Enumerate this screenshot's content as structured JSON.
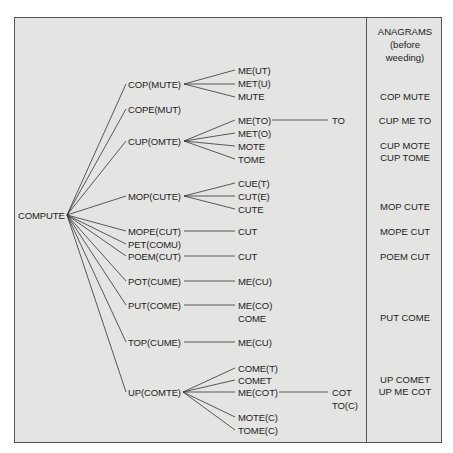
{
  "diagram": {
    "root": "COMPUTE",
    "level1": [
      {
        "label": "COP(MUTE)",
        "children": [
          "ME(UT)",
          "MET(U)",
          "MUTE"
        ]
      },
      {
        "label": "COPE(MUT)",
        "children": []
      },
      {
        "label": "CUP(OMTE)",
        "children": [
          "ME(TO)",
          "MET(O)",
          "MOTE",
          "TOME"
        ],
        "grandchildren": {
          "ME(TO)": [
            "TO"
          ]
        }
      },
      {
        "label": "MOP(CUTE)",
        "children": [
          "CUE(T)",
          "CUT(E)",
          "CUTE"
        ]
      },
      {
        "label": "MOPE(CUT)",
        "children": [
          "CUT"
        ]
      },
      {
        "label": "PET(COMU)",
        "children": []
      },
      {
        "label": "POEM(CUT)",
        "children": [
          "CUT"
        ]
      },
      {
        "label": "POT(CUME)",
        "children": [
          "ME(CU)"
        ]
      },
      {
        "label": "PUT(COME)",
        "children": [
          "ME(CO)",
          "COME"
        ]
      },
      {
        "label": "TOP(CUME)",
        "children": [
          "ME(CU)"
        ]
      },
      {
        "label": "UP(COMTE)",
        "children": [
          "COME(T)",
          "COMET",
          "ME(COT)",
          "MOTE(C)",
          "TOME(C)"
        ],
        "grandchildren": {
          "ME(COT)": [
            "COT",
            "TO(C)"
          ]
        }
      }
    ],
    "l1": {
      "cop_mute": "COP(MUTE)",
      "cope_mut": "COPE(MUT)",
      "cup_omte": "CUP(OMTE)",
      "mop_cute": "MOP(CUTE)",
      "mope_cut": "MOPE(CUT)",
      "pet_comu": "PET(COMU)",
      "poem_cut": "POEM(CUT)",
      "pot_cume": "POT(CUME)",
      "put_come": "PUT(COME)",
      "top_cume": "TOP(CUME)",
      "up_comte": "UP(COMTE)"
    },
    "l2": {
      "me_ut": "ME(UT)",
      "met_u": "MET(U)",
      "mute": "MUTE",
      "me_to": "ME(TO)",
      "met_o": "MET(O)",
      "mote": "MOTE",
      "tome": "TOME",
      "cue_t": "CUE(T)",
      "cut_e": "CUT(E)",
      "cute": "CUTE",
      "cut_a": "CUT",
      "cut_b": "CUT",
      "me_cu_a": "ME(CU)",
      "me_co": "ME(CO)",
      "come": "COME",
      "me_cu_b": "ME(CU)",
      "come_t": "COME(T)",
      "comet": "COMET",
      "me_cot": "ME(COT)",
      "mote_c": "MOTE(C)",
      "tome_c": "TOME(C)"
    },
    "l3": {
      "to": "TO",
      "cot": "COT",
      "to_c": "TO(C)"
    }
  },
  "anagrams": {
    "header": [
      "ANAGRAMS",
      "(before",
      "weeding)"
    ],
    "items": [
      "COP MUTE",
      "CUP ME TO",
      "CUP MOTE",
      "CUP TOME",
      "MOP CUTE",
      "MOPE CUT",
      "POEM CUT",
      "PUT COME",
      "UP COMET",
      "UP ME COT"
    ]
  },
  "colors": {
    "background": "#e4e4e2",
    "line": "#333333",
    "border": "#555555"
  }
}
